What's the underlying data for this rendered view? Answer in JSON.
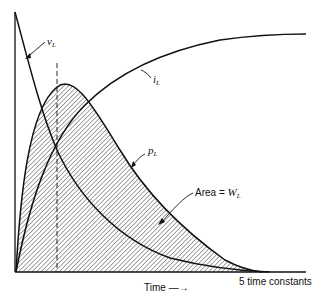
{
  "diagram": {
    "curves": [
      {
        "id": "v_L",
        "label_main": "v",
        "label_sub": "L",
        "description": "inductor voltage, exponential decay"
      },
      {
        "id": "i_L",
        "label_main": "i",
        "label_sub": "L",
        "description": "inductor current, exponential rise"
      },
      {
        "id": "p_L",
        "label_main": "p",
        "label_sub": "L",
        "description": "inductor power, product of v_L and i_L"
      }
    ],
    "area_label": {
      "prefix": "Area = ",
      "main": "W",
      "sub": "L"
    },
    "x_axis_label": "Time",
    "x_axis_arrow": "—→",
    "x_end_label": "5 time constants",
    "colors": {
      "line": "#111111",
      "hatch": "#333333",
      "background": "#ffffff"
    }
  }
}
